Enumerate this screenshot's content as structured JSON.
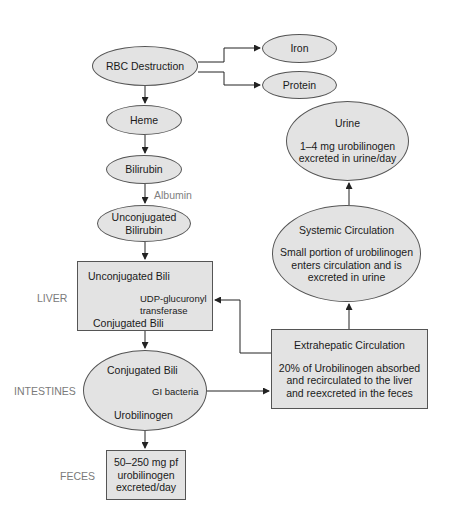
{
  "nodes": {
    "rbc": "RBC Destruction",
    "iron": "Iron",
    "protein": "Protein",
    "heme": "Heme",
    "bilirubin": "Bilirubin",
    "albumin": "Albumin",
    "unconj1": "Unconjugated",
    "unconj2": "Bilirubin",
    "liver_top": "Unconjugated Bili",
    "liver_enzyme1": "UDP-glucuronyl",
    "liver_enzyme2": "transferase",
    "liver_bottom": "Conjugated Bili",
    "int_top": "Conjugated Bili",
    "int_agent": "GI bacteria",
    "int_bottom": "Urobilinogen",
    "feces1": "50–250 mg pf",
    "feces2": "urobilinogen",
    "feces3": "excreted/day",
    "urine_title": "Urine",
    "urine1": "1–4 mg urobilinogen",
    "urine2": "excreted in urine/day",
    "sys_title": "Systemic Circulation",
    "sys1": "Small portion of urobilinogen",
    "sys2": "enters circulation and is",
    "sys3": "excreted in urine",
    "ext_title": "Extrahepatic Circulation",
    "ext1": "20% of Urobilinogen absorbed",
    "ext2": "and recirculated to the liver",
    "ext3": "and reexcreted in the feces"
  },
  "labels": {
    "liver": "LIVER",
    "intestines": "INTESTINES",
    "feces": "FECES"
  },
  "colors": {
    "fill": "#e3e3e3",
    "stroke": "#555555",
    "label": "#7a7a7a"
  }
}
